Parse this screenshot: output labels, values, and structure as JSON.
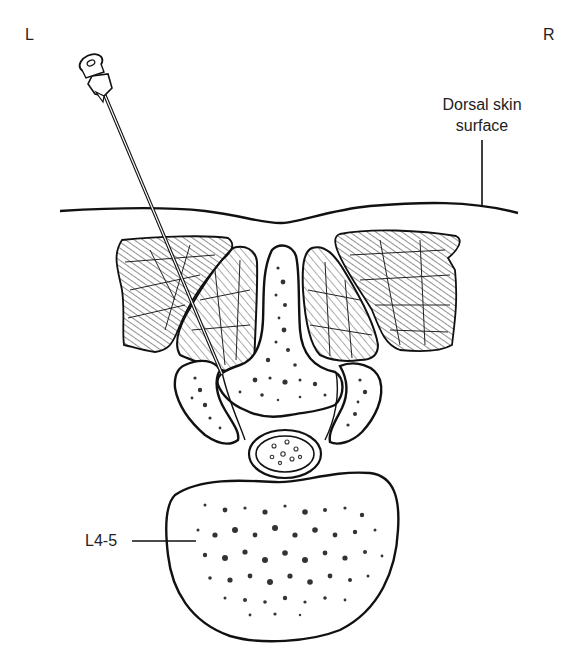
{
  "figure": {
    "type": "axial cross-section diagram",
    "orientation": {
      "left_label": "L",
      "right_label": "R"
    },
    "annotations": {
      "skin_label_line1": "Dorsal skin",
      "skin_label_line2": "surface",
      "level_label": "L4-5"
    },
    "structures": [
      "needle",
      "dorsal-skin-surface",
      "paraspinal-muscle-left-lateral",
      "paraspinal-muscle-left-medial",
      "paraspinal-muscle-right-medial",
      "paraspinal-muscle-right-lateral",
      "spinous-process-lamina",
      "facet-joint-left",
      "facet-joint-right",
      "thecal-sac",
      "vertebral-body"
    ],
    "colors": {
      "ink": "#111111",
      "hatch": "#555555",
      "background": "#ffffff"
    }
  }
}
